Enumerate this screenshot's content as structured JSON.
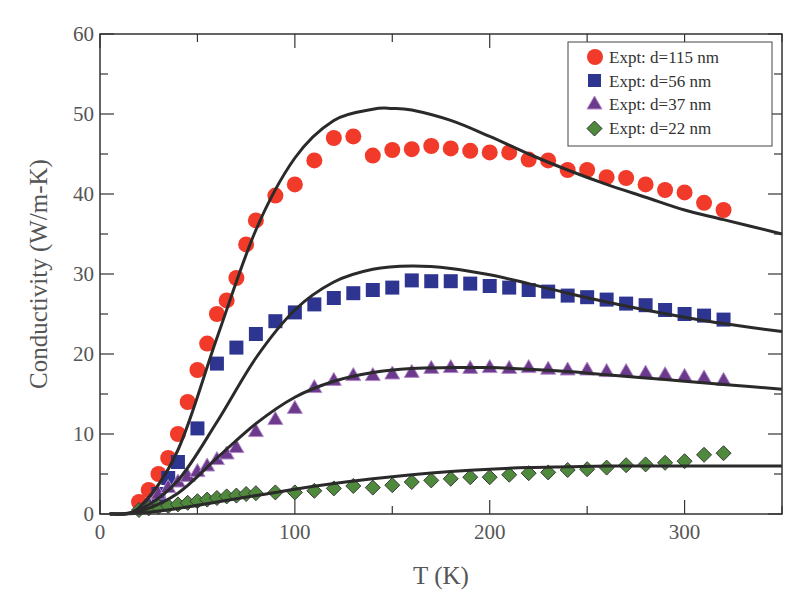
{
  "chart_data": {
    "type": "scatter",
    "title": "",
    "xlabel": "T (K)",
    "ylabel": "Conductivity (W/m-K)",
    "xlim": [
      0,
      350
    ],
    "ylim": [
      0,
      60
    ],
    "x_ticks": [
      0,
      100,
      200,
      300
    ],
    "y_ticks": [
      0,
      10,
      20,
      30,
      40,
      50,
      60
    ],
    "x_minor_step": 50,
    "y_minor_step": 5,
    "grid": false,
    "legend_position": "upper right",
    "series": [
      {
        "name": "Expt: d=115 nm",
        "marker": "circle",
        "color": "#f23a2a",
        "x": [
          20,
          25,
          30,
          35,
          40,
          45,
          50,
          55,
          60,
          65,
          70,
          75,
          80,
          90,
          100,
          110,
          120,
          130,
          140,
          150,
          160,
          170,
          180,
          190,
          200,
          210,
          220,
          230,
          240,
          250,
          260,
          270,
          280,
          290,
          300,
          310,
          320
        ],
        "y": [
          1.5,
          3,
          5,
          7,
          10,
          14,
          18,
          21.3,
          25,
          26.7,
          29.5,
          33.7,
          36.7,
          39.8,
          41.2,
          44.2,
          47,
          47.2,
          44.8,
          45.5,
          45.6,
          46,
          45.7,
          45.4,
          45.2,
          45.2,
          44.3,
          44.2,
          43,
          43,
          42.1,
          42,
          41.2,
          40.5,
          40.2,
          38.9,
          38
        ]
      },
      {
        "name": "Expt: d=56 nm",
        "marker": "square",
        "color": "#2d3590",
        "x": [
          30,
          35,
          40,
          50,
          60,
          70,
          80,
          90,
          100,
          110,
          120,
          130,
          140,
          150,
          160,
          170,
          180,
          190,
          200,
          210,
          220,
          230,
          240,
          250,
          260,
          270,
          280,
          290,
          300,
          310,
          320
        ],
        "y": [
          2.5,
          4.5,
          6.5,
          10.7,
          18.8,
          20.8,
          22.5,
          24.1,
          25.2,
          26.2,
          27,
          27.6,
          28,
          28.3,
          29.2,
          29.1,
          29.1,
          28.8,
          28.5,
          28.3,
          28,
          27.8,
          27.3,
          27.1,
          26.8,
          26.3,
          26.1,
          25.5,
          25,
          24.8,
          24.3
        ]
      },
      {
        "name": "Expt: d=37 nm",
        "marker": "triangle",
        "color": "#6b3a8c",
        "x": [
          25,
          30,
          35,
          40,
          45,
          50,
          55,
          60,
          65,
          70,
          80,
          90,
          100,
          110,
          120,
          130,
          140,
          150,
          160,
          170,
          180,
          190,
          200,
          210,
          220,
          230,
          240,
          250,
          260,
          270,
          280,
          290,
          300,
          310,
          320
        ],
        "y": [
          1.3,
          2.5,
          3.3,
          4,
          4.7,
          5.3,
          6,
          6.8,
          7.5,
          8.3,
          10.3,
          11.8,
          13.2,
          15.8,
          16.7,
          17.3,
          17.3,
          17.5,
          17.7,
          18.2,
          18.3,
          18.2,
          18.3,
          18.2,
          18.3,
          18.1,
          18,
          18,
          17.8,
          17.8,
          17.6,
          17.4,
          17.2,
          17,
          16.7
        ]
      },
      {
        "name": "Expt: d=22 nm",
        "marker": "diamond",
        "color": "#4f8a3c",
        "x": [
          20,
          25,
          30,
          35,
          40,
          45,
          50,
          55,
          60,
          65,
          70,
          75,
          80,
          90,
          100,
          110,
          120,
          130,
          140,
          150,
          160,
          170,
          180,
          190,
          200,
          210,
          220,
          230,
          240,
          250,
          260,
          270,
          280,
          290,
          300,
          310,
          320
        ],
        "y": [
          0.5,
          0.7,
          0.9,
          1,
          1.2,
          1.4,
          1.6,
          1.8,
          2,
          2.2,
          2.3,
          2.5,
          2.6,
          2.7,
          2.7,
          2.9,
          3.2,
          3.5,
          3.3,
          3.6,
          4,
          4.2,
          4.4,
          4.6,
          4.6,
          4.9,
          5.1,
          5.2,
          5.5,
          5.6,
          5.8,
          6.1,
          6.2,
          6.4,
          6.6,
          7.4,
          7.6
        ]
      },
      {
        "name": "Model d=115 nm",
        "marker": "line",
        "color": "#2a2a2a",
        "x": [
          5,
          20,
          40,
          60,
          80,
          100,
          120,
          140,
          150,
          160,
          180,
          200,
          220,
          240,
          260,
          280,
          300,
          320,
          350
        ],
        "y": [
          0,
          0.8,
          8,
          22,
          35.5,
          44.5,
          49.2,
          50.6,
          50.7,
          50.5,
          49.2,
          47.2,
          45,
          43,
          41.2,
          39.6,
          38,
          36.8,
          35
        ]
      },
      {
        "name": "Model d=56 nm",
        "marker": "line",
        "color": "#2a2a2a",
        "x": [
          5,
          20,
          40,
          60,
          80,
          100,
          120,
          140,
          160,
          180,
          200,
          220,
          240,
          260,
          280,
          300,
          320,
          350
        ],
        "y": [
          0,
          0.5,
          4.2,
          11.5,
          19.5,
          25.5,
          29,
          30.6,
          31,
          30.7,
          29.9,
          28.8,
          27.6,
          26.5,
          25.5,
          24.6,
          23.8,
          22.8
        ]
      },
      {
        "name": "Model d=37 nm",
        "marker": "line",
        "color": "#2a2a2a",
        "x": [
          5,
          20,
          40,
          60,
          80,
          100,
          120,
          140,
          160,
          180,
          200,
          220,
          240,
          260,
          280,
          300,
          320,
          350
        ],
        "y": [
          0,
          0.3,
          2.6,
          7,
          11.3,
          14.6,
          16.6,
          17.7,
          18.2,
          18.3,
          18.3,
          18.1,
          17.8,
          17.4,
          17,
          16.6,
          16.2,
          15.6
        ]
      },
      {
        "name": "Model d=22 nm",
        "marker": "line",
        "color": "#2a2a2a",
        "x": [
          5,
          20,
          40,
          60,
          80,
          100,
          120,
          140,
          160,
          180,
          200,
          220,
          240,
          260,
          280,
          300,
          320,
          350
        ],
        "y": [
          0,
          0.1,
          0.7,
          1.5,
          2.3,
          3.1,
          3.8,
          4.4,
          4.9,
          5.3,
          5.6,
          5.8,
          5.9,
          6,
          6,
          6,
          6,
          6
        ]
      }
    ]
  },
  "legend": {
    "items": [
      {
        "label": "Expt: d=115 nm",
        "marker": "circle",
        "color": "#f23a2a"
      },
      {
        "label": "Expt: d=56 nm",
        "marker": "square",
        "color": "#2d3590"
      },
      {
        "label": "Expt: d=37 nm",
        "marker": "triangle",
        "color": "#6b3a8c"
      },
      {
        "label": "Expt: d=22 nm",
        "marker": "diamond",
        "color": "#4f8a3c"
      }
    ]
  },
  "axes": {
    "xlabel": "T (K)",
    "ylabel": "Conductivity (W/m-K)",
    "x_tick_labels": [
      "0",
      "100",
      "200",
      "300"
    ],
    "y_tick_labels": [
      "0",
      "10",
      "20",
      "30",
      "40",
      "50",
      "60"
    ]
  }
}
